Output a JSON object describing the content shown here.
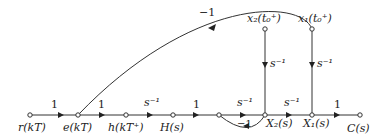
{
  "diagram": {
    "type": "signal-flow-graph",
    "nodes": [
      {
        "id": "r",
        "label": "r(kT)",
        "x": 30,
        "y": 115
      },
      {
        "id": "e",
        "label": "e(kT)",
        "x": 78,
        "y": 115
      },
      {
        "id": "h",
        "label": "h(kT⁺)",
        "x": 126,
        "y": 115
      },
      {
        "id": "H",
        "label": "H(s)",
        "x": 173,
        "y": 115
      },
      {
        "id": "m",
        "label": "",
        "x": 219,
        "y": 115
      },
      {
        "id": "X2",
        "label": "X₂(s)",
        "x": 265,
        "y": 115
      },
      {
        "id": "X1",
        "label": "X₁(s)",
        "x": 312,
        "y": 115
      },
      {
        "id": "C",
        "label": "C(s)",
        "x": 360,
        "y": 115
      },
      {
        "id": "x2i",
        "label": "x₂(t₀⁺)",
        "x": 265,
        "y": 29
      },
      {
        "id": "x1i",
        "label": "x₁(t₀⁺)",
        "x": 312,
        "y": 29
      }
    ],
    "edges": [
      {
        "from": "r",
        "to": "e",
        "gain": "1"
      },
      {
        "from": "e",
        "to": "h",
        "gain": "1"
      },
      {
        "from": "h",
        "to": "H",
        "gain": "s⁻¹"
      },
      {
        "from": "H",
        "to": "m",
        "gain": "1"
      },
      {
        "from": "m",
        "to": "X2",
        "gain": "s⁻¹"
      },
      {
        "from": "X2",
        "to": "m",
        "gain": "−1"
      },
      {
        "from": "X2",
        "to": "X1",
        "gain": "s⁻¹"
      },
      {
        "from": "X1",
        "to": "C",
        "gain": "1"
      },
      {
        "from": "x2i",
        "to": "X2",
        "gain": "s⁻¹"
      },
      {
        "from": "x1i",
        "to": "X1",
        "gain": "s⁻¹"
      },
      {
        "from": "X1",
        "to": "e",
        "gain": "−1"
      }
    ]
  },
  "labels": {
    "r": "r(kT)",
    "e": "e(kT)",
    "h": "h(kT⁺)",
    "H": "H(s)",
    "X2": "X₂(s)",
    "X1": "X₁(s)",
    "C": "C(s)",
    "x2i": "x₂(t₀⁺)",
    "x1i": "x₁(t₀⁺)"
  },
  "gains": {
    "r_e": "1",
    "e_h": "1",
    "h_H": "s⁻¹",
    "H_m": "1",
    "m_X2": "s⁻¹",
    "X2_m": "−1",
    "X2_X1": "s⁻¹",
    "X1_C": "1",
    "x2i_X2": "s⁻¹",
    "x1i_X1": "s⁻¹",
    "feedback": "−1"
  }
}
